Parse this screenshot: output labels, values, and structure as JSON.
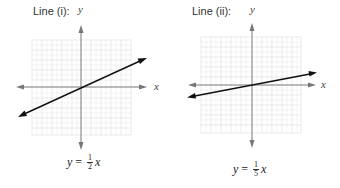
{
  "panels": [
    {
      "title": "Line (i):",
      "x_axis_label": "x",
      "y_axis_label": "y",
      "equation": {
        "lhs": "y",
        "equals": "=",
        "numerator": "1",
        "denominator": "2",
        "var": "x"
      },
      "slope": 0.5
    },
    {
      "title": "Line (ii):",
      "x_axis_label": "x",
      "y_axis_label": "y",
      "equation": {
        "lhs": "y",
        "equals": "=",
        "numerator": "1",
        "denominator": "5",
        "var": "x"
      },
      "slope": 0.2
    }
  ],
  "colors": {
    "grid": "#d9d9d9",
    "axis": "#777777",
    "line": "#111111"
  }
}
